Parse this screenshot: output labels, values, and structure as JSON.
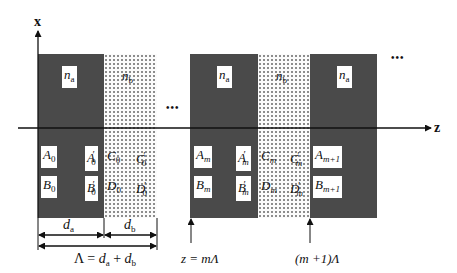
{
  "axes": {
    "x_label": "x",
    "z_label": "z"
  },
  "layers": {
    "cell0": {
      "a": {
        "index_label": "n",
        "index_sub": "a",
        "left_coeffs": [
          {
            "main": "A",
            "sub": "0"
          },
          {
            "main": "B",
            "sub": "0"
          }
        ],
        "right_coeffs": [
          {
            "main": "A",
            "prime": "′",
            "sub": "0"
          },
          {
            "main": "B",
            "prime": "′",
            "sub": "0"
          }
        ]
      },
      "b": {
        "index_label": "n",
        "index_sub": "b",
        "left_coeffs": [
          {
            "main": "C",
            "sub": "0"
          },
          {
            "main": "D",
            "sub": "0"
          }
        ],
        "right_coeffs": [
          {
            "main": "C",
            "prime": "′",
            "sub": "0"
          },
          {
            "main": "D",
            "prime": "′",
            "sub": "0"
          }
        ]
      }
    },
    "cellm": {
      "a": {
        "index_label": "n",
        "index_sub": "a",
        "left_coeffs": [
          {
            "main": "A",
            "sub": "m"
          },
          {
            "main": "B",
            "sub": "m"
          }
        ],
        "right_coeffs": [
          {
            "main": "A",
            "prime": "′",
            "sub": "m"
          },
          {
            "main": "B",
            "prime": "′",
            "sub": "m"
          }
        ]
      },
      "b": {
        "index_label": "n",
        "index_sub": "b",
        "left_coeffs": [
          {
            "main": "C",
            "sub": "m"
          },
          {
            "main": "D",
            "sub": "m"
          }
        ],
        "right_coeffs": [
          {
            "main": "C",
            "prime": "′",
            "sub": "m"
          },
          {
            "main": "D",
            "prime": "′",
            "sub": "m"
          }
        ]
      }
    },
    "cellm1": {
      "a": {
        "index_label": "n",
        "index_sub": "a",
        "left_coeffs": [
          {
            "main": "A",
            "sub": "m+1"
          },
          {
            "main": "B",
            "sub": "m+1"
          }
        ]
      }
    }
  },
  "ellipsis": "•••",
  "dimensions": {
    "da": {
      "main": "d",
      "sub": "a"
    },
    "db": {
      "main": "d",
      "sub": "b"
    },
    "period": {
      "lhs": "Λ = ",
      "d1": "d",
      "s1": "a",
      "plus": " + ",
      "d2": "d",
      "s2": "b"
    }
  },
  "markers": {
    "z_m": "z = mΛ",
    "z_m1": "(m +1)Λ"
  },
  "colors": {
    "layer_a": "#4a4a4a",
    "layer_b_dots": "#888888",
    "line": "#111111"
  }
}
